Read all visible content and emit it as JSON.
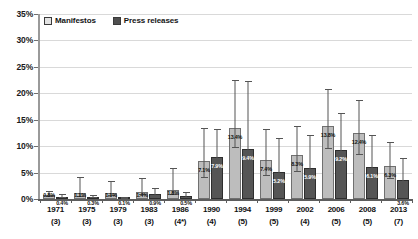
{
  "legend": {
    "position": "top-left",
    "items": [
      {
        "label": "Manifestos",
        "color": "#bdbdbd",
        "key": "manifestos"
      },
      {
        "label": "Press releases",
        "color": "#555555",
        "key": "press"
      }
    ]
  },
  "axis": {
    "y_ticks": [
      "0%",
      "5%",
      "10%",
      "15%",
      "20%",
      "25%",
      "30%",
      "35%"
    ],
    "y_min": 0,
    "y_max": 35
  },
  "chart_data": {
    "type": "bar",
    "title": "",
    "subtitle": "",
    "xlabel": "",
    "ylabel": "",
    "ylim": [
      0,
      35
    ],
    "yticks": [
      0,
      5,
      10,
      15,
      20,
      25,
      30,
      35
    ],
    "ytick_labels": [
      "0%",
      "5%",
      "10%",
      "15%",
      "20%",
      "25%",
      "30%",
      "35%"
    ],
    "grid": true,
    "legend_position": "top-left",
    "error_bars": true,
    "categories": [
      "1971",
      "1975",
      "1979",
      "1983",
      "1986",
      "1990",
      "1994",
      "1999",
      "2002",
      "2006",
      "2008",
      "2013"
    ],
    "category_counts": [
      "(3)",
      "(3)",
      "(3)",
      "(3)",
      "(4*)",
      "(4)",
      "(5)",
      "(5)",
      "(4)",
      "(5)",
      "(5)",
      "(7)"
    ],
    "series": [
      {
        "name": "Manifestos",
        "color": "#bdbdbd",
        "values": [
          0.8,
          1.1,
          1.1,
          1.4,
          1.8,
          7.1,
          13.4,
          7.4,
          8.3,
          13.8,
          12.4,
          6.3
        ],
        "labels": [
          "0.8%",
          "1.1%",
          "1.1%",
          "1.4%",
          "1.8%",
          "7.1%",
          "13.4%",
          "7.4%",
          "8.3%",
          "13.8%",
          "12.4%",
          "6.3%"
        ],
        "err_low": [
          0.4,
          0.7,
          0.6,
          0.7,
          1.1,
          3.1,
          3.8,
          3.0,
          3.2,
          4.3,
          4.0,
          2.6
        ],
        "err_high": [
          0.7,
          3.0,
          2.4,
          2.6,
          4.0,
          6.3,
          9.2,
          5.8,
          5.6,
          7.1,
          6.4,
          4.4
        ]
      },
      {
        "name": "Press releases",
        "color": "#555555",
        "values": [
          0.4,
          0.3,
          0.1,
          0.9,
          0.5,
          7.9,
          9.4,
          5.2,
          5.9,
          9.2,
          6.1,
          3.6
        ],
        "labels": [
          "0.4%",
          "0.3%",
          "0.1%",
          "0.9%",
          "0.5%",
          "7.9%",
          "9.4%",
          "5.2%",
          "5.9%",
          "9.2%",
          "6.1%",
          "3.6%"
        ],
        "err_low": [
          0.3,
          0.2,
          0.1,
          0.5,
          0.4,
          3.4,
          4.1,
          2.6,
          2.9,
          4.1,
          3.0,
          2.0
        ],
        "err_high": [
          0.6,
          0.5,
          0.3,
          1.2,
          0.9,
          5.4,
          12.9,
          6.4,
          6.3,
          7.0,
          6.0,
          4.1
        ]
      }
    ]
  }
}
